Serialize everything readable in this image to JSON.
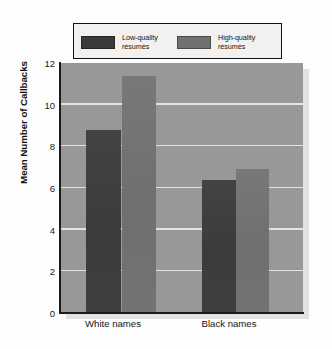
{
  "chart_data": {
    "type": "bar",
    "title": "",
    "subtitle": "",
    "xlabel": "",
    "ylabel": "Mean Number of Callbacks",
    "categories": [
      "White names",
      "Black names"
    ],
    "series": [
      {
        "name": "Low-quality résumés",
        "color": "#3f3f3f",
        "values": [
          8.8,
          6.4
        ]
      },
      {
        "name": "High-quality résumés",
        "color": "#737373",
        "values": [
          11.4,
          6.9
        ]
      }
    ],
    "ylim": [
      0,
      12
    ],
    "yticks": [
      0,
      2,
      4,
      6,
      8,
      10,
      12
    ],
    "ytick_labels": [
      "0",
      "2",
      "4",
      "6",
      "8",
      "10",
      "12"
    ],
    "grid": "horizontal",
    "gridline_color": "#e9e9e9",
    "plot_background": "#989898",
    "legend_position": "top-center",
    "legend_entries": [
      "Low-quality résumés",
      "High-quality résumés"
    ]
  },
  "legend": {
    "entries": [
      {
        "label_line1": "Low-quality",
        "label_line2": "résumés",
        "swatch_color": "#3a3a3a"
      },
      {
        "label_line1": "High-quality",
        "label_line2": "résumés",
        "swatch_color": "#707070"
      }
    ]
  },
  "axes": {
    "y_title": "Mean Number of Callbacks",
    "y_tick_labels": [
      "12",
      "10",
      "8",
      "6",
      "4",
      "2",
      "0"
    ],
    "x_tick_labels": [
      "White names",
      "Black names"
    ]
  }
}
